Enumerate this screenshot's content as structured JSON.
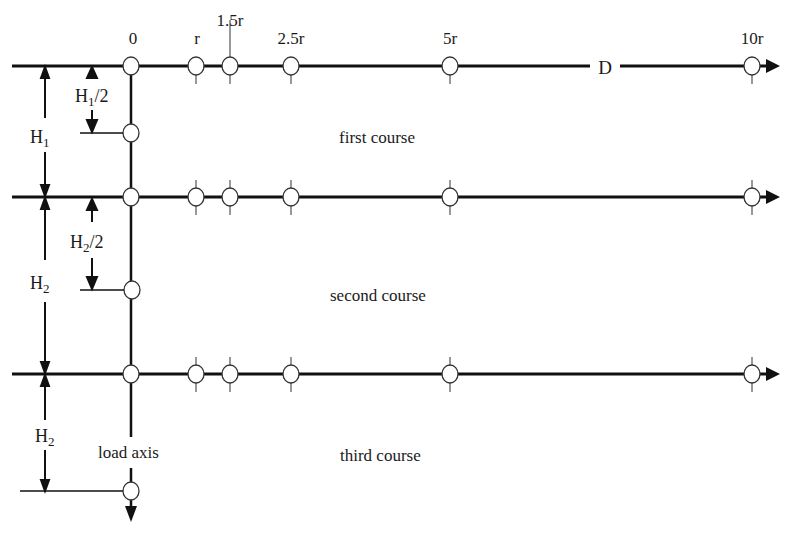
{
  "diagram": {
    "axis_labels": {
      "origin": "0",
      "r": "r",
      "r1_5": "1.5r",
      "r2_5": "2.5r",
      "r5": "5r",
      "r10": "10r",
      "distance": "D"
    },
    "dimensions": {
      "h1": {
        "base": "H",
        "sub": "1"
      },
      "h1_half": {
        "base": "H",
        "sub": "1",
        "suffix": "/2"
      },
      "h2": {
        "base": "H",
        "sub": "2"
      },
      "h2_half": {
        "base": "H",
        "sub": "2",
        "suffix": "/2"
      },
      "h3": {
        "base": "H",
        "sub": "2"
      }
    },
    "courses": [
      {
        "label": "first course"
      },
      {
        "label": "second course"
      },
      {
        "label": "third course"
      }
    ],
    "load_axis_label": "load axis",
    "colors": {
      "line": "#111111",
      "circle_fill": "#ffffff",
      "background": "#ffffff"
    }
  }
}
